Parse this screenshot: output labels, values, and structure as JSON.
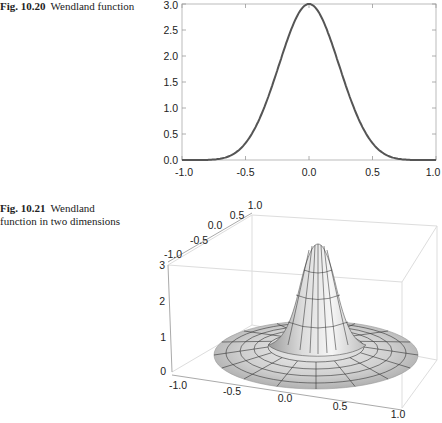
{
  "figures": [
    {
      "number": "Fig. 10.20",
      "caption": "Wendland function"
    },
    {
      "number": "Fig. 10.21",
      "caption": "function in two dimensions",
      "caption_first_word": "Wendland"
    }
  ],
  "colors": {
    "curve": "#555555",
    "frame": "#bbbbbb",
    "surface_light": "#f2f2f2",
    "surface_dark": "#a8a8a8",
    "mesh": "#333333",
    "box": "#dddddd"
  },
  "chart_data": [
    {
      "type": "line",
      "title": "Wendland function",
      "xlabel": "",
      "ylabel": "",
      "xlim": [
        -1.0,
        1.0
      ],
      "ylim": [
        0.0,
        3.0
      ],
      "x_ticks": [
        "-1.0",
        "-0.5",
        "0.0",
        "0.5",
        "1.0"
      ],
      "y_ticks": [
        "0.0",
        "0.5",
        "1.0",
        "1.5",
        "2.0",
        "2.5",
        "3.0"
      ],
      "grid": false,
      "x": [
        -1.0,
        -0.9,
        -0.8,
        -0.7,
        -0.6,
        -0.5,
        -0.4,
        -0.3,
        -0.2,
        -0.1,
        0.0,
        0.1,
        0.2,
        0.3,
        0.4,
        0.5,
        0.6,
        0.7,
        0.8,
        0.9,
        1.0
      ],
      "series": [
        {
          "name": "phi(x)",
          "values": [
            0.0,
            0.0,
            0.003,
            0.024,
            0.108,
            0.324,
            0.737,
            1.359,
            2.097,
            2.737,
            3.0,
            2.737,
            2.097,
            1.359,
            0.737,
            0.324,
            0.108,
            0.024,
            0.003,
            0.0,
            0.0
          ]
        }
      ]
    },
    {
      "type": "surface3d",
      "title": "Wendland function in two dimensions",
      "x_ticks": [
        "-1.0",
        "-0.5",
        "0.0",
        "0.5",
        "1.0"
      ],
      "y_ticks": [
        "-1.0",
        "-0.5",
        "0.0",
        "0.5",
        "1.0"
      ],
      "z_ticks": [
        "0",
        "1",
        "2",
        "3"
      ],
      "xlim": [
        -1.0,
        1.0
      ],
      "ylim": [
        -1.0,
        1.0
      ],
      "zlim": [
        0,
        3
      ],
      "peak": {
        "x": 0.0,
        "y": 0.0,
        "z": 3.0
      },
      "support_radius": 1.0
    }
  ]
}
